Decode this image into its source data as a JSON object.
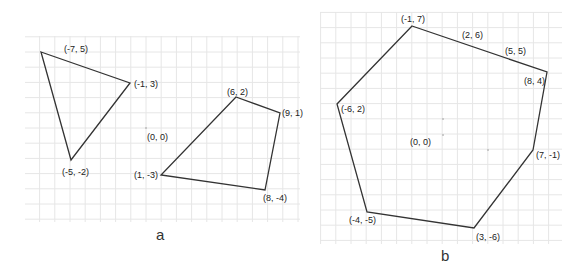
{
  "panels": [
    {
      "id": "a",
      "caption": "a",
      "origin_label": "(0, 0)",
      "shapes": [
        {
          "name": "triangle",
          "vertices": [
            {
              "label": "(-7, 5)",
              "x": -7,
              "y": 5
            },
            {
              "label": "(-1, 3)",
              "x": -1,
              "y": 3
            },
            {
              "label": "(-5, -2)",
              "x": -5,
              "y": -2
            }
          ]
        },
        {
          "name": "quadrilateral",
          "vertices": [
            {
              "label": "(6, 2)",
              "x": 6,
              "y": 2
            },
            {
              "label": "(9, 1)",
              "x": 9,
              "y": 1
            },
            {
              "label": "(8, -4)",
              "x": 8,
              "y": -4
            },
            {
              "label": "(1, -3)",
              "x": 1,
              "y": -3
            }
          ]
        }
      ]
    },
    {
      "id": "b",
      "caption": "b",
      "origin_label": "(0, 0)",
      "shapes": [
        {
          "name": "hexagon",
          "vertices": [
            {
              "label": "(-1, 7)",
              "x": -1,
              "y": 7
            },
            {
              "label": "(8, 4)",
              "x": 8,
              "y": 4
            },
            {
              "label": "(7, -1)",
              "x": 7,
              "y": -1
            },
            {
              "label": "(3, -6)",
              "x": 3,
              "y": -6
            },
            {
              "label": "(-4, -5)",
              "x": -4,
              "y": -5
            },
            {
              "label": "(-6, 2)",
              "x": -6,
              "y": 2
            }
          ],
          "edge_points": [
            {
              "label": "(2, 6)",
              "x": 2,
              "y": 6
            },
            {
              "label": "(5, 5)",
              "x": 5,
              "y": 5
            }
          ]
        }
      ]
    }
  ]
}
